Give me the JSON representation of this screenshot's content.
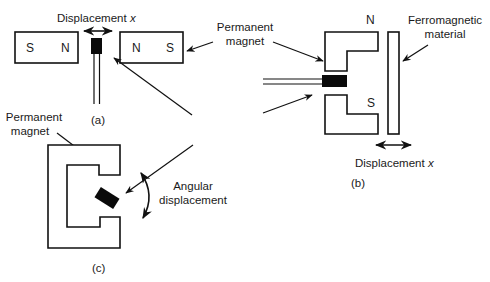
{
  "diagram": {
    "panel_a": {
      "caption": "(a)",
      "displacement_label": "Displacement",
      "displacement_var": "x",
      "left_magnet": {
        "pole_left": "S",
        "pole_right": "N"
      },
      "right_magnet": {
        "pole_left": "N",
        "pole_right": "S"
      }
    },
    "shared_label": {
      "line1": "Permanent",
      "line2": "magnet"
    },
    "panel_b": {
      "caption": "(b)",
      "pole_top": "N",
      "pole_bottom": "S",
      "ferro_line1": "Ferromagnetic",
      "ferro_line2": "material",
      "displacement_label": "Displacement",
      "displacement_var": "x"
    },
    "panel_c": {
      "caption": "(c)",
      "magnet_line1": "Permanent",
      "magnet_line2": "magnet",
      "angular_line1": "Angular",
      "angular_line2": "displacement"
    },
    "colors": {
      "ink": "#111111",
      "background": "#ffffff"
    }
  }
}
